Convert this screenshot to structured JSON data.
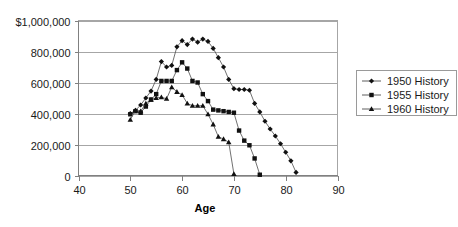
{
  "chart_data": {
    "type": "line",
    "title": "",
    "xlabel": "Age",
    "ylabel": "",
    "xlim": [
      40,
      90
    ],
    "ylim": [
      0,
      1000000
    ],
    "grid": true,
    "legend_position": "right",
    "xticks": [
      40,
      50,
      60,
      70,
      80,
      90
    ],
    "xtick_labels": [
      "40",
      "50",
      "60",
      "70",
      "80",
      "90"
    ],
    "yticks": [
      0,
      200000,
      400000,
      600000,
      800000,
      1000000
    ],
    "ytick_labels": [
      "0",
      "200,000",
      "400,000",
      "600,000",
      "800,000",
      "$1,000,000"
    ],
    "series": [
      {
        "name": "1950 History",
        "marker": "diamond",
        "x": [
          50,
          51,
          52,
          53,
          54,
          55,
          56,
          57,
          58,
          59,
          60,
          61,
          62,
          63,
          64,
          65,
          66,
          67,
          68,
          69,
          70,
          71,
          72,
          73,
          74,
          75,
          76,
          77,
          78,
          79,
          80,
          81,
          82
        ],
        "y": [
          400000,
          420000,
          455000,
          500000,
          545000,
          620000,
          735000,
          700000,
          710000,
          830000,
          870000,
          845000,
          880000,
          860000,
          880000,
          865000,
          820000,
          760000,
          700000,
          620000,
          560000,
          555000,
          555000,
          550000,
          465000,
          410000,
          350000,
          300000,
          255000,
          205000,
          150000,
          95000,
          20000
        ]
      },
      {
        "name": "1955 History",
        "marker": "square",
        "x": [
          50,
          51,
          52,
          53,
          54,
          55,
          56,
          57,
          58,
          59,
          60,
          61,
          62,
          63,
          64,
          65,
          66,
          67,
          68,
          69,
          70,
          71,
          72,
          73,
          74,
          75
        ],
        "y": [
          395000,
          415000,
          405000,
          445000,
          490000,
          525000,
          610000,
          610000,
          610000,
          680000,
          730000,
          690000,
          610000,
          600000,
          525000,
          480000,
          425000,
          420000,
          415000,
          410000,
          405000,
          290000,
          225000,
          195000,
          110000,
          5000
        ]
      },
      {
        "name": "1960 History",
        "marker": "triangle",
        "x": [
          50,
          51,
          52,
          53,
          54,
          55,
          56,
          57,
          58,
          59,
          60,
          61,
          62,
          63,
          64,
          65,
          66,
          67,
          68,
          69,
          70
        ],
        "y": [
          360000,
          420000,
          415000,
          465000,
          490000,
          500000,
          505000,
          495000,
          570000,
          540000,
          520000,
          465000,
          450000,
          450000,
          450000,
          395000,
          330000,
          250000,
          235000,
          215000,
          10000
        ]
      }
    ]
  },
  "legend": {
    "items": [
      {
        "label": "1950 History",
        "marker": "diamond"
      },
      {
        "label": "1955 History",
        "marker": "square"
      },
      {
        "label": "1960 History",
        "marker": "triangle"
      }
    ]
  }
}
